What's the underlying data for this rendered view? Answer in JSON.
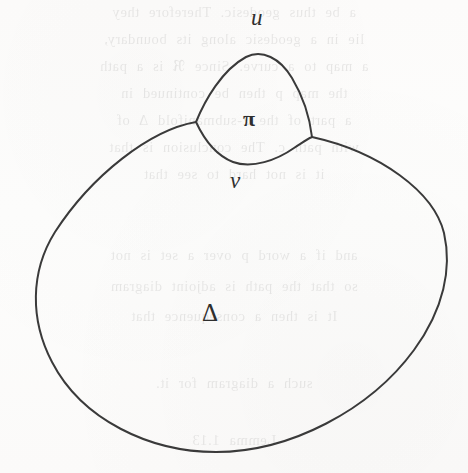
{
  "figure": {
    "kind": "mathematical-diagram",
    "medium": "scanned-book-page",
    "background_color": "#fdfcfb",
    "stroke_color": "#3a3a3a",
    "stroke_width": 2,
    "labels": {
      "vertex_top": "u",
      "vertex_bottom": "v",
      "inner_region": "π",
      "outer_region": "Δ"
    },
    "regions": [
      {
        "name": "outer-region",
        "label": "Δ"
      },
      {
        "name": "inner-bubble-region",
        "label": "π"
      }
    ],
    "vertices": [
      {
        "name": "vertex-u",
        "label": "u",
        "x": 258,
        "y": 55
      },
      {
        "name": "vertex-v",
        "label": "v",
        "x": 248,
        "y": 163
      },
      {
        "name": "junction-left",
        "label": "",
        "x": 196,
        "y": 122
      },
      {
        "name": "junction-right",
        "label": "",
        "x": 312,
        "y": 137
      }
    ],
    "paths": {
      "outer_boundary": "M 196 122 C 150 130, 92 175, 55 232 C 30 272, 30 320, 52 362 C 82 420, 150 452, 216 452 C 290 452, 370 410, 414 350 C 444 309, 452 268, 444 233 C 434 192, 380 152, 312 137",
      "bubble_upper_arc": "M 196 122 C 205 100, 222 70, 246 57 C 262 49, 280 58, 292 78 C 304 98, 310 120, 312 137",
      "bubble_lower_arc": "M 196 122 C 203 137, 215 155, 233 162 C 252 169, 277 160, 294 148 C 303 142, 309 138, 312 137"
    }
  },
  "bleed_through_text": {
    "visible": true,
    "note": "faint mirrored show-through from reverse page",
    "lines": [
      "a be thus geodesic. Therefore they",
      "lie in a geodesic along its boundary,",
      "a map to a curve. Since ℜ is a path",
      "the map p then be continued in",
      "a part of the 2-submanifold Δ of",
      "with path c. The conclusion is that",
      "it is not hard to see that",
      "",
      "",
      "",
      "",
      "and if a word p over a set is not",
      "so that the path is adjoint diagram",
      "It is then a consequence that",
      "",
      "such a diagram for it.",
      "Lemma 1.13"
    ]
  }
}
